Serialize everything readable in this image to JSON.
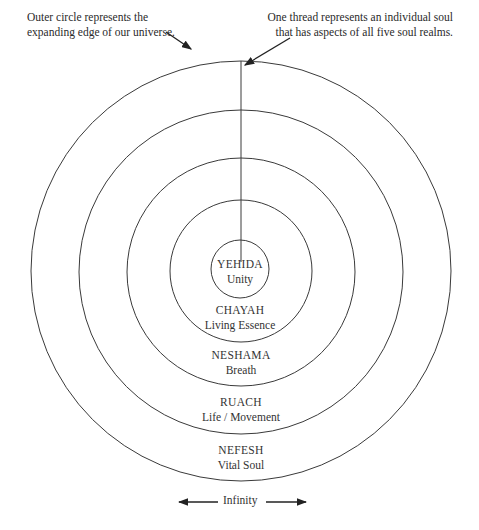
{
  "annotations": {
    "outer_circle_note": [
      "Outer circle represents the",
      "expanding edge of our universe."
    ],
    "thread_note": [
      "One thread represents an individual soul",
      "that has aspects of all five soul realms."
    ]
  },
  "realms": [
    {
      "name": "YEHIDA",
      "meaning": "Unity"
    },
    {
      "name": "CHAYAH",
      "meaning": "Living Essence"
    },
    {
      "name": "NESHAMA",
      "meaning": "Breath"
    },
    {
      "name": "RUACH",
      "meaning": "Life / Movement"
    },
    {
      "name": "NEFESH",
      "meaning": "Vital Soul"
    }
  ],
  "footer": {
    "infinity_label": "Infinity"
  },
  "colors": {
    "stroke": "#3a3a3a",
    "text": "#2a2a2a",
    "background": "#ffffff"
  }
}
